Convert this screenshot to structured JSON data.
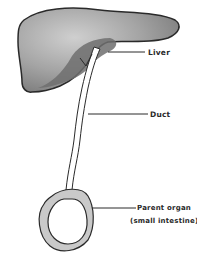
{
  "diagram": {
    "type": "anatomical-schematic",
    "nodes": [
      {
        "id": "liver",
        "label": "Liver",
        "shape": "lobed-organ",
        "fill": "#9a9a9a"
      },
      {
        "id": "duct",
        "label": "Duct",
        "shape": "tube",
        "fill": "#ffffff"
      },
      {
        "id": "parent",
        "label": "Parent organ",
        "sublabel": "(small intestine)",
        "shape": "ring",
        "fill": "#c8c8c8"
      }
    ],
    "edges": [
      {
        "from": "liver",
        "to": "duct"
      },
      {
        "from": "duct",
        "to": "parent"
      }
    ]
  },
  "labels": {
    "liver": "Liver",
    "duct": "Duct",
    "parent_line1": "Parent organ",
    "parent_line2": "(small intestine)"
  },
  "colors": {
    "outline": "#2a2a2a",
    "liver_fill": "#9e9e9e",
    "liver_highlight": "#c4c4c4",
    "liver_shadow": "#6a6a6a",
    "ring_fill": "#c9c9c9"
  }
}
